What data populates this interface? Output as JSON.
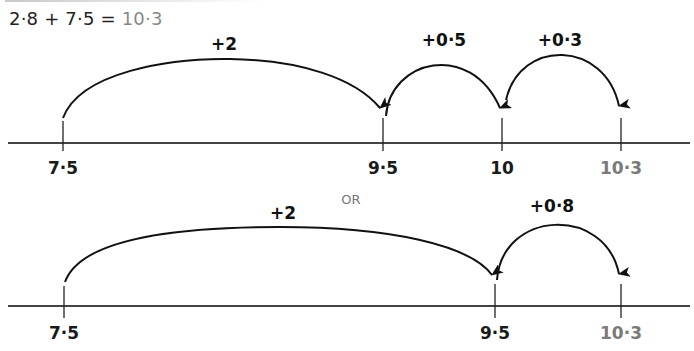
{
  "equation": {
    "lhs": "2·8 + 7·5 =",
    "result": "10·3"
  },
  "separator": "OR",
  "number_lines": [
    {
      "name": "three-step",
      "points": [
        {
          "label": "7·5",
          "value": 7.5,
          "color": "#1a1a1a"
        },
        {
          "label": "9·5",
          "value": 9.5,
          "color": "#1a1a1a"
        },
        {
          "label": "10",
          "value": 10,
          "color": "#1a1a1a"
        },
        {
          "label": "10·3",
          "value": 10.3,
          "color": "#7a7a7a"
        }
      ],
      "jumps": [
        {
          "label": "+2",
          "from": 7.5,
          "to": 9.5
        },
        {
          "label": "+0·5",
          "from": 9.5,
          "to": 10
        },
        {
          "label": "+0·3",
          "from": 10,
          "to": 10.3
        }
      ]
    },
    {
      "name": "two-step",
      "points": [
        {
          "label": "7·5",
          "value": 7.5,
          "color": "#1a1a1a"
        },
        {
          "label": "9·5",
          "value": 9.5,
          "color": "#1a1a1a"
        },
        {
          "label": "10·3",
          "value": 10.3,
          "color": "#7a7a7a"
        }
      ],
      "jumps": [
        {
          "label": "+2",
          "from": 7.5,
          "to": 9.5
        },
        {
          "label": "+0·8",
          "from": 9.5,
          "to": 10.3
        }
      ]
    }
  ]
}
